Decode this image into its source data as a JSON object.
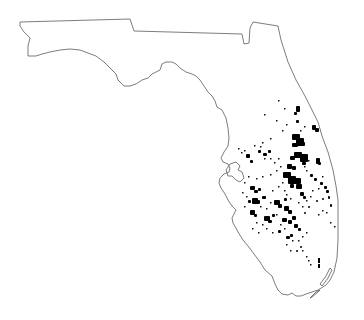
{
  "map": {
    "subject": "Florida distribution map",
    "width": 364,
    "height": 320,
    "colors": {
      "background": "#ffffff",
      "outline": "#6e6e6e",
      "occurrence": "#000000"
    },
    "outline": [
      [
        20,
        22
      ],
      [
        130,
        19
      ],
      [
        134,
        31
      ],
      [
        242,
        34
      ],
      [
        244,
        44
      ],
      [
        249,
        43
      ],
      [
        250,
        28
      ],
      [
        253,
        22
      ],
      [
        278,
        26
      ],
      [
        281,
        40
      ],
      [
        288,
        62
      ],
      [
        296,
        80
      ],
      [
        305,
        96
      ],
      [
        312,
        110
      ],
      [
        318,
        122
      ],
      [
        322,
        136
      ],
      [
        328,
        152
      ],
      [
        333,
        170
      ],
      [
        336,
        186
      ],
      [
        338,
        200
      ],
      [
        338,
        220
      ],
      [
        338,
        240
      ],
      [
        337,
        258
      ],
      [
        334,
        272
      ],
      [
        330,
        280
      ],
      [
        326,
        285
      ],
      [
        318,
        290
      ],
      [
        312,
        292
      ],
      [
        306,
        294
      ],
      [
        301,
        296
      ],
      [
        296,
        296
      ],
      [
        292,
        293
      ],
      [
        288,
        295
      ],
      [
        282,
        294
      ],
      [
        278,
        290
      ],
      [
        275,
        284
      ],
      [
        272,
        276
      ],
      [
        265,
        270
      ],
      [
        260,
        262
      ],
      [
        254,
        254
      ],
      [
        248,
        246
      ],
      [
        243,
        240
      ],
      [
        238,
        232
      ],
      [
        236,
        228
      ],
      [
        233,
        223
      ],
      [
        232,
        218
      ],
      [
        234,
        214
      ],
      [
        236,
        210
      ],
      [
        232,
        206
      ],
      [
        228,
        200
      ],
      [
        225,
        194
      ],
      [
        221,
        188
      ],
      [
        219,
        183
      ],
      [
        220,
        178
      ],
      [
        224,
        174
      ],
      [
        229,
        172
      ],
      [
        230,
        168
      ],
      [
        228,
        164
      ],
      [
        223,
        162
      ],
      [
        221,
        158
      ],
      [
        224,
        152
      ],
      [
        228,
        146
      ],
      [
        229,
        138
      ],
      [
        228,
        128
      ],
      [
        226,
        118
      ],
      [
        222,
        110
      ],
      [
        217,
        107
      ],
      [
        215,
        101
      ],
      [
        212,
        96
      ],
      [
        208,
        92
      ],
      [
        204,
        86
      ],
      [
        200,
        80
      ],
      [
        196,
        76
      ],
      [
        192,
        74
      ],
      [
        186,
        72
      ],
      [
        180,
        68
      ],
      [
        176,
        64
      ],
      [
        172,
        62
      ],
      [
        166,
        62
      ],
      [
        162,
        64
      ],
      [
        160,
        70
      ],
      [
        156,
        72
      ],
      [
        152,
        74
      ],
      [
        148,
        78
      ],
      [
        142,
        80
      ],
      [
        136,
        84
      ],
      [
        130,
        86
      ],
      [
        124,
        86
      ],
      [
        118,
        80
      ],
      [
        116,
        74
      ],
      [
        110,
        68
      ],
      [
        104,
        62
      ],
      [
        96,
        56
      ],
      [
        88,
        53
      ],
      [
        80,
        50
      ],
      [
        70,
        49
      ],
      [
        60,
        50
      ],
      [
        50,
        52
      ],
      [
        42,
        54
      ],
      [
        36,
        56
      ],
      [
        28,
        56
      ],
      [
        28,
        46
      ],
      [
        30,
        38
      ],
      [
        24,
        32
      ],
      [
        20,
        26
      ],
      [
        20,
        22
      ]
    ],
    "bay_outline": [
      [
        226,
        170
      ],
      [
        230,
        164
      ],
      [
        236,
        162
      ],
      [
        240,
        166
      ],
      [
        238,
        170
      ],
      [
        242,
        172
      ],
      [
        244,
        178
      ],
      [
        240,
        182
      ],
      [
        236,
        180
      ],
      [
        232,
        176
      ],
      [
        228,
        176
      ],
      [
        226,
        170
      ]
    ],
    "keys": [
      [
        [
          322,
          286
        ],
        [
          328,
          278
        ],
        [
          332,
          270
        ],
        [
          330,
          268
        ],
        [
          326,
          276
        ],
        [
          320,
          284
        ],
        [
          322,
          286
        ]
      ],
      [
        [
          312,
          297
        ],
        [
          318,
          292
        ],
        [
          320,
          290
        ],
        [
          316,
          292
        ],
        [
          310,
          298
        ],
        [
          312,
          297
        ]
      ]
    ],
    "patches": [
      [
        296,
        106,
        4,
        6
      ],
      [
        294,
        112,
        3,
        3
      ],
      [
        296,
        120,
        3,
        3
      ],
      [
        312,
        125,
        4,
        5
      ],
      [
        315,
        128,
        4,
        4
      ],
      [
        292,
        134,
        8,
        6
      ],
      [
        296,
        138,
        8,
        8
      ],
      [
        300,
        142,
        5,
        4
      ],
      [
        292,
        143,
        6,
        4
      ],
      [
        294,
        152,
        8,
        6
      ],
      [
        300,
        154,
        8,
        8
      ],
      [
        290,
        156,
        5,
        4
      ],
      [
        302,
        162,
        4,
        3
      ],
      [
        316,
        158,
        4,
        6
      ],
      [
        318,
        162,
        3,
        3
      ],
      [
        287,
        164,
        5,
        5
      ],
      [
        292,
        166,
        4,
        4
      ],
      [
        283,
        172,
        8,
        6
      ],
      [
        288,
        176,
        8,
        8
      ],
      [
        294,
        178,
        7,
        6
      ],
      [
        296,
        184,
        6,
        5
      ],
      [
        290,
        184,
        4,
        4
      ],
      [
        300,
        192,
        4,
        4
      ],
      [
        303,
        196,
        3,
        3
      ],
      [
        246,
        154,
        4,
        4
      ],
      [
        258,
        150,
        3,
        3
      ],
      [
        263,
        153,
        4,
        3
      ],
      [
        268,
        150,
        3,
        3
      ],
      [
        250,
        160,
        3,
        3
      ],
      [
        250,
        186,
        5,
        4
      ],
      [
        254,
        190,
        4,
        3
      ],
      [
        258,
        188,
        3,
        3
      ],
      [
        252,
        198,
        6,
        6
      ],
      [
        256,
        200,
        4,
        4
      ],
      [
        262,
        196,
        4,
        3
      ],
      [
        248,
        200,
        3,
        3
      ],
      [
        250,
        210,
        5,
        5
      ],
      [
        254,
        214,
        3,
        3
      ],
      [
        274,
        200,
        6,
        5
      ],
      [
        278,
        204,
        4,
        4
      ],
      [
        284,
        198,
        3,
        3
      ],
      [
        284,
        206,
        5,
        5
      ],
      [
        288,
        210,
        4,
        4
      ],
      [
        264,
        216,
        6,
        5
      ],
      [
        268,
        220,
        4,
        3
      ],
      [
        272,
        214,
        3,
        3
      ],
      [
        282,
        218,
        5,
        4
      ],
      [
        288,
        220,
        4,
        4
      ],
      [
        292,
        216,
        4,
        4
      ],
      [
        294,
        224,
        4,
        4
      ],
      [
        298,
        228,
        3,
        3
      ],
      [
        278,
        230,
        3,
        3
      ],
      [
        286,
        236,
        4,
        3
      ],
      [
        290,
        234,
        3,
        3
      ],
      [
        310,
        174,
        3,
        3
      ],
      [
        314,
        178,
        3,
        3
      ],
      [
        320,
        182,
        3,
        3
      ],
      [
        324,
        186,
        3,
        3
      ],
      [
        326,
        190,
        3,
        3
      ],
      [
        328,
        196,
        2,
        3
      ],
      [
        322,
        198,
        2,
        2
      ],
      [
        316,
        200,
        2,
        2
      ],
      [
        304,
        212,
        2,
        2
      ],
      [
        308,
        206,
        2,
        2
      ],
      [
        330,
        204,
        2,
        3
      ],
      [
        296,
        250,
        2,
        2
      ],
      [
        300,
        246,
        2,
        2
      ]
    ],
    "specks": [
      [
        238,
        148
      ],
      [
        241,
        152
      ],
      [
        244,
        150
      ],
      [
        254,
        145
      ],
      [
        260,
        146
      ],
      [
        264,
        158
      ],
      [
        270,
        158
      ],
      [
        274,
        162
      ],
      [
        278,
        158
      ],
      [
        280,
        166
      ],
      [
        276,
        170
      ],
      [
        270,
        174
      ],
      [
        262,
        176
      ],
      [
        256,
        178
      ],
      [
        248,
        176
      ],
      [
        244,
        182
      ],
      [
        242,
        192
      ],
      [
        246,
        196
      ],
      [
        244,
        206
      ],
      [
        260,
        206
      ],
      [
        266,
        208
      ],
      [
        270,
        202
      ],
      [
        272,
        190
      ],
      [
        278,
        186
      ],
      [
        282,
        182
      ],
      [
        284,
        190
      ],
      [
        286,
        194
      ],
      [
        290,
        198
      ],
      [
        298,
        202
      ],
      [
        302,
        206
      ],
      [
        306,
        200
      ],
      [
        310,
        196
      ],
      [
        312,
        190
      ],
      [
        318,
        188
      ],
      [
        322,
        176
      ],
      [
        306,
        170
      ],
      [
        304,
        166
      ],
      [
        308,
        160
      ],
      [
        300,
        130
      ],
      [
        304,
        126
      ],
      [
        278,
        100
      ],
      [
        284,
        108
      ],
      [
        264,
        114
      ],
      [
        276,
        120
      ],
      [
        286,
        124
      ],
      [
        282,
        130
      ],
      [
        270,
        138
      ],
      [
        262,
        142
      ],
      [
        276,
        214
      ],
      [
        280,
        224
      ],
      [
        284,
        228
      ],
      [
        292,
        240
      ],
      [
        286,
        244
      ],
      [
        298,
        240
      ],
      [
        302,
        236
      ],
      [
        306,
        232
      ],
      [
        272,
        232
      ],
      [
        266,
        228
      ],
      [
        262,
        224
      ],
      [
        256,
        222
      ],
      [
        252,
        228
      ],
      [
        258,
        232
      ],
      [
        318,
        214
      ],
      [
        322,
        210
      ],
      [
        326,
        212
      ],
      [
        330,
        222
      ],
      [
        334,
        226
      ],
      [
        306,
        256
      ],
      [
        308,
        260
      ],
      [
        310,
        264
      ],
      [
        290,
        250
      ],
      [
        302,
        250
      ]
    ],
    "markers_south": [
      [
        [
          318,
          258,
          2,
          5
        ],
        [
          318,
          264,
          2,
          4
        ]
      ]
    ]
  }
}
